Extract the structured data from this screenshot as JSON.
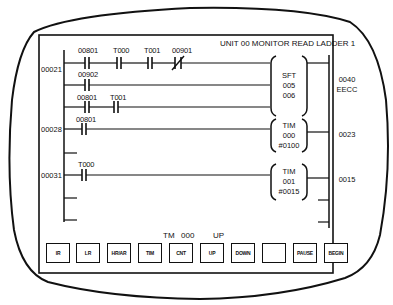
{
  "screen": {
    "title": "UNIT 00 MONITOR READ LADDER 1"
  },
  "rungs": [
    {
      "address": "00021",
      "branches": [
        {
          "contacts": [
            {
              "label": "00801",
              "type": "NO"
            },
            {
              "label": "T000",
              "type": "NO"
            },
            {
              "label": "T001",
              "type": "NO"
            },
            {
              "label": "00901",
              "type": "NC"
            }
          ]
        },
        {
          "contacts": [
            {
              "label": "00902",
              "type": "NO"
            }
          ]
        },
        {
          "contacts": [
            {
              "label": "00801",
              "type": "NO"
            },
            {
              "label": "T001",
              "type": "NO"
            }
          ]
        }
      ],
      "instruction": {
        "name": "SFT",
        "operands": [
          "005",
          "006"
        ]
      },
      "output": [
        "0040",
        "EECC"
      ]
    },
    {
      "address": "00028",
      "branches": [
        {
          "contacts": [
            {
              "label": "00801",
              "type": "NO"
            }
          ]
        }
      ],
      "instruction": {
        "name": "TIM",
        "operands": [
          "000",
          "#0100"
        ]
      },
      "output": [
        "0023"
      ]
    },
    {
      "address": "00031",
      "branches": [
        {
          "contacts": [
            {
              "label": "T000",
              "type": "NO"
            }
          ]
        }
      ],
      "instruction": {
        "name": "TIM",
        "operands": [
          "001",
          "#0015"
        ]
      },
      "output": [
        "0015"
      ]
    }
  ],
  "status_line": {
    "item": "TM",
    "number": "000",
    "direction": "UP"
  },
  "function_keys": [
    "IR",
    "LR",
    "HR/AR",
    "TIM",
    "CNT",
    "UP",
    "DOWN",
    "",
    "PAUSE",
    "BEGIN"
  ]
}
